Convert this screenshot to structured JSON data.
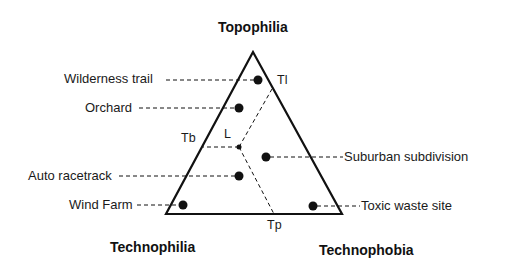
{
  "diagram": {
    "vertices": {
      "top": "Topophilia",
      "bottom_left": "Technophilia",
      "bottom_right": "Technophobia"
    },
    "axis_markers": {
      "tl": "Tl",
      "tb": "Tb",
      "tp": "Tp",
      "center": "L"
    },
    "places": [
      {
        "label": "Wilderness trail",
        "side": "left"
      },
      {
        "label": "Orchard",
        "side": "left"
      },
      {
        "label": "Auto racetrack",
        "side": "left"
      },
      {
        "label": "Wind Farm",
        "side": "left"
      },
      {
        "label": "Suburban subdivision",
        "side": "right"
      },
      {
        "label": "Toxic waste site",
        "side": "right"
      }
    ],
    "colors": {
      "line": "#111111",
      "background": "#ffffff"
    }
  }
}
